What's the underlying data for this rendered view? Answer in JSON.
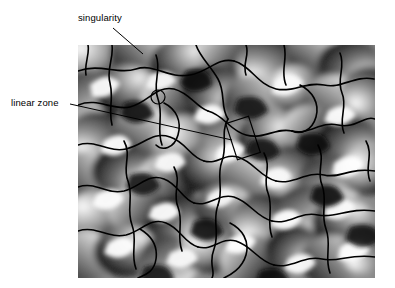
{
  "figure": {
    "type": "annotated-image",
    "background": "#ffffff",
    "image": {
      "name": "phase-gradient-field",
      "description": "grayscale orientation / phase field with dark contour curves",
      "left": 78,
      "top": 45,
      "width": 297,
      "height": 233,
      "colors": {
        "light": "#ffffff",
        "mid": "#808080",
        "dark": "#1a1a1a",
        "contour": "#000000"
      }
    }
  },
  "annotations": {
    "singularity": {
      "label": "singularity",
      "label_x": 78,
      "label_y": 12,
      "leader": {
        "x1": 113,
        "y1": 28,
        "x2": 143,
        "y2": 54
      },
      "marker": {
        "shape": "circle",
        "cx": 158,
        "cy": 97,
        "r": 7
      },
      "marker_name": "singularity-circle-marker"
    },
    "linear_zone": {
      "label": "linear zone",
      "label_x": 11,
      "label_y": 97,
      "leader": {
        "x1": 70,
        "y1": 104,
        "x2": 232,
        "y2": 140
      },
      "marker": {
        "shape": "rectangle",
        "cx": 243,
        "cy": 138,
        "w": 24,
        "h": 38,
        "rotation_deg": -18
      },
      "marker_name": "linear-zone-rect-marker"
    }
  },
  "colors": {
    "text": "#000000",
    "leader_line": "#000000",
    "marker_stroke": "#000000",
    "page_background": "#ffffff"
  }
}
